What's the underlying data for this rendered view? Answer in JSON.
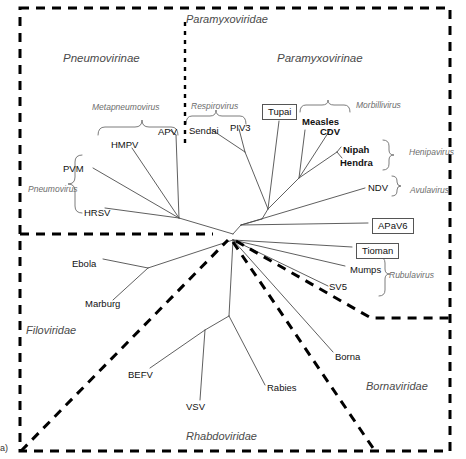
{
  "figure": {
    "panel_marker": "a)",
    "type": "unrooted-phylogenetic-tree"
  },
  "families": [
    {
      "name": "Paramyxoviridae",
      "x": 186,
      "y": 14
    },
    {
      "name": "Filoviridae",
      "x": 26,
      "y": 325
    },
    {
      "name": "Rhabdoviridae",
      "x": 186,
      "y": 431
    },
    {
      "name": "Bornaviridae",
      "x": 366,
      "y": 381
    }
  ],
  "subfamilies": [
    {
      "name": "Pneumovirinae",
      "x": 63,
      "y": 53
    },
    {
      "name": "Paramyxovirinae",
      "x": 277,
      "y": 53
    }
  ],
  "genera": [
    {
      "name": "Metapneumovirus",
      "x": 92,
      "y": 103
    },
    {
      "name": "Pneumovirus",
      "x": 28,
      "y": 185
    },
    {
      "name": "Respirovirus",
      "x": 191,
      "y": 102
    },
    {
      "name": "Morbillivirus",
      "x": 356,
      "y": 101
    },
    {
      "name": "Henipavirus",
      "x": 409,
      "y": 148
    },
    {
      "name": "Avulavirus",
      "x": 410,
      "y": 186
    },
    {
      "name": "Rubulavirus",
      "x": 389,
      "y": 271
    }
  ],
  "tips": [
    {
      "label": "HMPV",
      "x": 111,
      "y": 140,
      "boxed": false
    },
    {
      "label": "APV",
      "x": 158,
      "y": 127,
      "boxed": false
    },
    {
      "label": "PVM",
      "x": 63,
      "y": 164,
      "boxed": false
    },
    {
      "label": "HRSV",
      "x": 84,
      "y": 208,
      "boxed": false
    },
    {
      "label": "Sendai",
      "x": 189,
      "y": 126,
      "boxed": false
    },
    {
      "label": "PIV3",
      "x": 230,
      "y": 123,
      "boxed": false
    },
    {
      "label": "Tupai",
      "x": 262,
      "y": 104,
      "boxed": true
    },
    {
      "label": "Measles",
      "x": 302,
      "y": 117,
      "boxed": false
    },
    {
      "label": "CDV",
      "x": 320,
      "y": 127,
      "boxed": false
    },
    {
      "label": "Nipah",
      "x": 343,
      "y": 145,
      "boxed": false
    },
    {
      "label": "Hendra",
      "x": 340,
      "y": 158,
      "boxed": false
    },
    {
      "label": "NDV",
      "x": 368,
      "y": 183,
      "boxed": false
    },
    {
      "label": "APaV6",
      "x": 372,
      "y": 218,
      "boxed": true
    },
    {
      "label": "Tioman",
      "x": 356,
      "y": 243,
      "boxed": true
    },
    {
      "label": "Mumps",
      "x": 350,
      "y": 265,
      "boxed": false
    },
    {
      "label": "SV5",
      "x": 329,
      "y": 282,
      "boxed": false
    },
    {
      "label": "Ebola",
      "x": 72,
      "y": 259,
      "boxed": false
    },
    {
      "label": "Marburg",
      "x": 85,
      "y": 299,
      "boxed": false
    },
    {
      "label": "BEFV",
      "x": 128,
      "y": 370,
      "boxed": false
    },
    {
      "label": "VSV",
      "x": 186,
      "y": 402,
      "boxed": false
    },
    {
      "label": "Rabies",
      "x": 267,
      "y": 383,
      "boxed": false
    },
    {
      "label": "Borna",
      "x": 335,
      "y": 352,
      "boxed": false
    }
  ],
  "colors": {
    "background": "#ffffff",
    "branch": "#4d4d4d",
    "boundary": "#000000",
    "tip_text": "#111111",
    "genus_text": "#6d6d6d",
    "family_text": "#4a4a4a",
    "box_border": "#555555"
  },
  "boundaries": {
    "outer_dashed_rect": "Paramyxoviridae outer border",
    "subfamily_divider": "vertical dashed line separating Pneumovirinae from Paramyxovirinae",
    "filoviridae_border": "horizontal dashed line at left",
    "rhabdoviridae_border": "diagonal dashed wedge",
    "bornaviridae_border": "stepped dashed line at right"
  }
}
